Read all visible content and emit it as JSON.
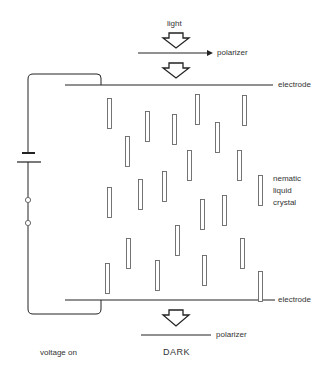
{
  "labels": {
    "light": "light",
    "polarizer_top": "polarizer",
    "electrode_top": "electrode",
    "nematic_line1": "nematic",
    "nematic_line2": "liquid",
    "nematic_line3": "crystal",
    "electrode_bottom": "electrode",
    "polarizer_bottom": "polarizer",
    "voltage_state": "voltage on",
    "output_state": "DARK"
  },
  "colors": {
    "line": "#222222",
    "rod": "#666666",
    "text": "#333333"
  },
  "rods": [
    {
      "x": 107,
      "y": 98
    },
    {
      "x": 145,
      "y": 111
    },
    {
      "x": 125,
      "y": 136
    },
    {
      "x": 172,
      "y": 114
    },
    {
      "x": 195,
      "y": 94
    },
    {
      "x": 215,
      "y": 122
    },
    {
      "x": 242,
      "y": 95
    },
    {
      "x": 187,
      "y": 150
    },
    {
      "x": 237,
      "y": 150
    },
    {
      "x": 107,
      "y": 187
    },
    {
      "x": 138,
      "y": 179
    },
    {
      "x": 162,
      "y": 171
    },
    {
      "x": 258,
      "y": 175
    },
    {
      "x": 200,
      "y": 199
    },
    {
      "x": 222,
      "y": 195
    },
    {
      "x": 175,
      "y": 225
    },
    {
      "x": 126,
      "y": 238
    },
    {
      "x": 240,
      "y": 238
    },
    {
      "x": 105,
      "y": 263
    },
    {
      "x": 155,
      "y": 260
    },
    {
      "x": 202,
      "y": 255
    },
    {
      "x": 258,
      "y": 271
    }
  ]
}
